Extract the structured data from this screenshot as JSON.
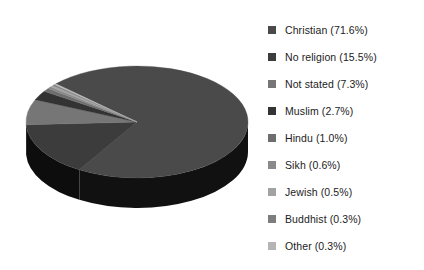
{
  "chart_data": {
    "type": "pie",
    "title": "",
    "three_d": true,
    "legend_position": "right",
    "categories": [
      "Christian",
      "No religion",
      "Not stated",
      "Muslim",
      "Hindu",
      "Sikh",
      "Jewish",
      "Buddhist",
      "Other"
    ],
    "values": [
      71.6,
      15.5,
      7.3,
      2.7,
      1.0,
      0.6,
      0.5,
      0.3,
      0.3
    ],
    "unit": "%",
    "slices": [
      {
        "label": "Christian",
        "value": 71.6,
        "legend_text": "Christian (71.6%)",
        "color": "#4a4a4a",
        "side_color": "#111111"
      },
      {
        "label": "No religion",
        "value": 15.5,
        "legend_text": "No religion (15.5%)",
        "color": "#3c3c3c",
        "side_color": "#0d0d0d"
      },
      {
        "label": "Not stated",
        "value": 7.3,
        "legend_text": "Not stated (7.3%)",
        "color": "#767676",
        "side_color": "#232323"
      },
      {
        "label": "Muslim",
        "value": 2.7,
        "legend_text": "Muslim (2.7%)",
        "color": "#333333",
        "side_color": "#0a0a0a"
      },
      {
        "label": "Hindu",
        "value": 1.0,
        "legend_text": "Hindu (1.0%)",
        "color": "#6e6e6e",
        "side_color": "#1f1f1f"
      },
      {
        "label": "Sikh",
        "value": 0.6,
        "legend_text": "Sikh (0.6%)",
        "color": "#8a8a8a",
        "side_color": "#2b2b2b"
      },
      {
        "label": "Jewish",
        "value": 0.5,
        "legend_text": "Jewish (0.5%)",
        "color": "#a3a3a3",
        "side_color": "#333333"
      },
      {
        "label": "Buddhist",
        "value": 0.3,
        "legend_text": "Buddhist (0.3%)",
        "color": "#7d7d7d",
        "side_color": "#262626"
      },
      {
        "label": "Other",
        "value": 0.3,
        "legend_text": "Other (0.3%)",
        "color": "#b5b5b5",
        "side_color": "#3a3a3a"
      }
    ],
    "background": "#ffffff",
    "text_color": "#1c1c1c"
  },
  "legend": {
    "items": [
      {
        "label": "Christian (71.6%)",
        "color": "#4a4a4a"
      },
      {
        "label": "No religion (15.5%)",
        "color": "#3c3c3c"
      },
      {
        "label": "Not stated (7.3%)",
        "color": "#767676"
      },
      {
        "label": "Muslim (2.7%)",
        "color": "#333333"
      },
      {
        "label": "Hindu (1.0%)",
        "color": "#6e6e6e"
      },
      {
        "label": "Sikh (0.6%)",
        "color": "#8a8a8a"
      },
      {
        "label": "Jewish (0.5%)",
        "color": "#a3a3a3"
      },
      {
        "label": "Buddhist (0.3%)",
        "color": "#7d7d7d"
      },
      {
        "label": "Other (0.3%)",
        "color": "#b5b5b5"
      }
    ]
  }
}
